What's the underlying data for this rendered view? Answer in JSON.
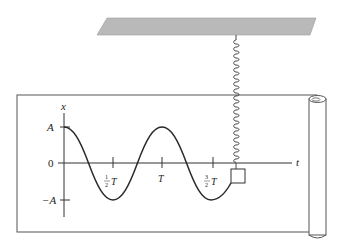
{
  "diagram": {
    "colors": {
      "ink": "#2a2a2a",
      "ceiling": "#b9b9b9",
      "paper_edge": "#555555",
      "background": "#ffffff"
    },
    "axis": {
      "y_label": "x",
      "x_label": "t",
      "y_ticks": [
        {
          "label": "A",
          "value": 1
        },
        {
          "label": "0",
          "value": 0
        },
        {
          "label": "−A",
          "value": -1
        }
      ],
      "x_ticks": [
        {
          "frac_num": "1",
          "frac_den": "2",
          "suffix": "T",
          "value": 0.5
        },
        {
          "frac_num": "",
          "frac_den": "",
          "suffix": "T",
          "value": 1.0
        },
        {
          "frac_num": "3",
          "frac_den": "2",
          "suffix": "T",
          "value": 1.5
        }
      ]
    },
    "curve": {
      "function": "x(t) = A cos(2πt/T)",
      "t_range_periods": [
        0,
        1.75
      ]
    },
    "elements": {
      "ceiling": "fixed support",
      "spring": "coil spring",
      "mass": "block",
      "paper": "paper strip",
      "roll": "paper roll"
    }
  }
}
